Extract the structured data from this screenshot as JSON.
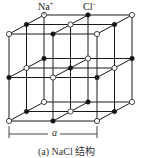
{
  "labels": {
    "na_ion": "Na",
    "na_charge": "+",
    "cl_ion": "Cl",
    "cl_charge": "-",
    "lattice_constant": "a"
  },
  "caption": "(a) NaCl 结构",
  "lattice": {
    "grid": [
      3,
      3,
      3
    ],
    "origin": [
      9,
      34
    ],
    "step_x": 44,
    "step_y": 43.5,
    "depth_dx": 17.5,
    "depth_dy": -9.5,
    "open_ion": "Na+",
    "filled_ion": "Cl-"
  },
  "colors": {
    "line": "#1a1a1a",
    "filled_atom": "#111111",
    "open_atom_fill": "#ffffff"
  }
}
